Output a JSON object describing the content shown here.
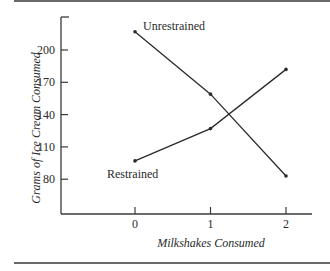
{
  "chart_data": {
    "type": "line",
    "title": "",
    "xlabel": "Milkshakes Consumed",
    "ylabel": "Grams of Ice Cream Consumed",
    "x": [
      0,
      1,
      2
    ],
    "x_tick_labels": [
      "0",
      "1",
      "2"
    ],
    "y_ticks": [
      80,
      110,
      140,
      170,
      200
    ],
    "y_tick_labels": [
      "80",
      "110",
      "140",
      "170",
      "200"
    ],
    "ylim": [
      48,
      230
    ],
    "xlim": [
      -0.98,
      2.28
    ],
    "grid": false,
    "legend": "inline labels",
    "series": [
      {
        "name": "Unrestrained",
        "values": [
          217,
          159,
          83
        ],
        "label_anchor": "start-right"
      },
      {
        "name": "Restrained",
        "values": [
          97,
          127,
          182
        ],
        "label_anchor": "start-below"
      }
    ]
  },
  "colors": {
    "line": "#2b2b2b",
    "axis": "#3a3a3a",
    "rule": "#6a6a6a",
    "text": "#2a2a2a"
  }
}
